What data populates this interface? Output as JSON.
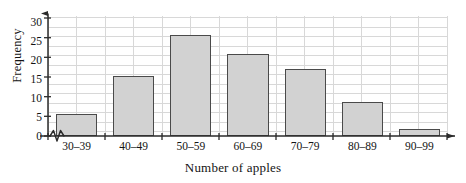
{
  "chart_data": {
    "type": "bar",
    "title": "",
    "xlabel": "Number of apples",
    "ylabel": "Frequency",
    "categories": [
      "30–39",
      "40–49",
      "50–59",
      "60–69",
      "70–79",
      "80–89",
      "90–99"
    ],
    "values": [
      6,
      16,
      27,
      22,
      18,
      9,
      2
    ],
    "series": [
      {
        "name": "Frequency",
        "values": [
          6,
          16,
          27,
          22,
          18,
          9,
          2
        ]
      }
    ],
    "ylim": [
      0,
      32
    ],
    "ytick_labels": [
      "0",
      "5",
      "10",
      "15",
      "20",
      "25",
      "30"
    ],
    "ytick_values": [
      0,
      5,
      10,
      15,
      20,
      25,
      30
    ],
    "grid": true,
    "legend": false,
    "legend_position": "none",
    "annotations": {
      "y_axis_break": "zigzag break symbol at origin",
      "y_axis_arrow": "arrowhead at top of vertical axis",
      "x_axis_arrow": "arrowhead at right end of horizontal axis"
    },
    "colors": {
      "bar_fill": "#d2d2d2",
      "bar_border": "#4a4a4a",
      "gridline": "#d8d8d8",
      "axis": "#2b2b2b",
      "text": "#141414",
      "background": "#ffffff"
    }
  },
  "figure": {
    "top_caption_clipped": ""
  }
}
